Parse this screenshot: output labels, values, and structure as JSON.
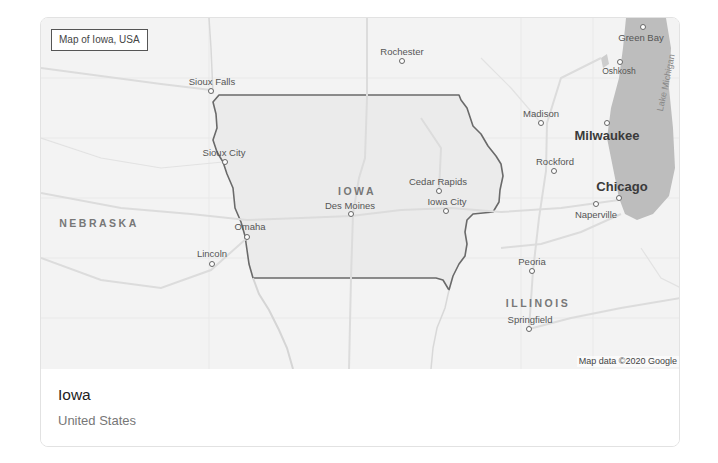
{
  "card": {
    "map_caption": "Map of Iowa, USA",
    "attribution": "Map data ©2020 Google",
    "title": "Iowa",
    "subtitle": "United States"
  },
  "map": {
    "colors": {
      "land": "#f3f3f3",
      "highlight_region": "#ebebeb",
      "water": "#bdbdbd",
      "border": "#6a6a6a",
      "roads": "#dedede"
    },
    "states": [
      {
        "id": "iowa",
        "label": "IOWA",
        "x": 316,
        "y": 168
      },
      {
        "id": "nebraska",
        "label": "NEBRASKA",
        "x": 58,
        "y": 201
      },
      {
        "id": "illinois",
        "label": "ILLINOIS",
        "x": 498,
        "y": 282
      }
    ],
    "water": [
      {
        "id": "lake-michigan",
        "label": "Lake Michigan",
        "x": 619,
        "y": 80
      }
    ],
    "cities": [
      {
        "id": "sioux-falls",
        "label": "Sioux Falls",
        "x": 171,
        "y": 72,
        "dot_x": 170,
        "dot_y": 73,
        "size": "normal",
        "label_dx": 0,
        "label_dy": -14
      },
      {
        "id": "rochester",
        "label": "Rochester",
        "x": 361,
        "y": 33,
        "dot_x": 361,
        "dot_y": 43,
        "size": "normal",
        "label_dx": 0,
        "label_dy": -14
      },
      {
        "id": "green-bay",
        "label": "Green Bay",
        "x": 603,
        "y": 18,
        "dot_x": 602,
        "dot_y": 11,
        "size": "normal",
        "label_dx": 0,
        "label_dy": 5
      },
      {
        "id": "oshkosh",
        "label": "Oshkosh",
        "x": 579,
        "y": 50,
        "dot_x": 579,
        "dot_y": 44,
        "size": "normal",
        "label_dx": 0,
        "label_dy": 4
      },
      {
        "id": "madison",
        "label": "Madison",
        "x": 500,
        "y": 94,
        "dot_x": 500,
        "dot_y": 105,
        "size": "normal",
        "label_dx": 0,
        "label_dy": -14
      },
      {
        "id": "milwaukee",
        "label": "Milwaukee",
        "x": 566,
        "y": 115,
        "dot_x": 566,
        "dot_y": 106,
        "size": "big",
        "label_dx": 0,
        "label_dy": 5
      },
      {
        "id": "sioux-city",
        "label": "Sioux City",
        "x": 183,
        "y": 133,
        "dot_x": 184,
        "dot_y": 144,
        "size": "normal",
        "label_dx": 0,
        "label_dy": -14
      },
      {
        "id": "rockford",
        "label": "Rockford",
        "x": 516,
        "y": 142,
        "dot_x": 513,
        "dot_y": 153,
        "size": "normal",
        "label_dx": 0,
        "label_dy": -14
      },
      {
        "id": "chicago",
        "label": "Chicago",
        "x": 581,
        "y": 167,
        "dot_x": 578,
        "dot_y": 180,
        "size": "big",
        "label_dx": 0,
        "label_dy": -17
      },
      {
        "id": "cedar-rapids",
        "label": "Cedar Rapids",
        "x": 395,
        "y": 162,
        "dot_x": 398,
        "dot_y": 173,
        "size": "normal",
        "label_dx": 0,
        "label_dy": -14
      },
      {
        "id": "iowa-city",
        "label": "Iowa City",
        "x": 406,
        "y": 180,
        "dot_x": 405,
        "dot_y": 193,
        "size": "normal",
        "label_dx": 0,
        "label_dy": -14
      },
      {
        "id": "des-moines",
        "label": "Des Moines",
        "x": 309,
        "y": 185,
        "dot_x": 310,
        "dot_y": 196,
        "size": "normal",
        "label_dx": 0,
        "label_dy": -14
      },
      {
        "id": "naperville",
        "label": "Naperville",
        "x": 556,
        "y": 194,
        "dot_x": 555,
        "dot_y": 185,
        "size": "normal",
        "label_dx": 0,
        "label_dy": 5
      },
      {
        "id": "omaha",
        "label": "Omaha",
        "x": 206,
        "y": 207,
        "dot_x": 206,
        "dot_y": 219,
        "size": "normal",
        "label_dx": 0,
        "label_dy": -14
      },
      {
        "id": "lincoln",
        "label": "Lincoln",
        "x": 171,
        "y": 230,
        "dot_x": 171,
        "dot_y": 244,
        "size": "normal",
        "label_dx": 0,
        "label_dy": -14
      },
      {
        "id": "peoria",
        "label": "Peoria",
        "x": 491,
        "y": 241,
        "dot_x": 491,
        "dot_y": 253,
        "size": "normal",
        "label_dx": 0,
        "label_dy": -14
      },
      {
        "id": "springfield",
        "label": "Springfield",
        "x": 488,
        "y": 297,
        "dot_x": 488,
        "dot_y": 311,
        "size": "normal",
        "label_dx": 0,
        "label_dy": -14
      }
    ]
  }
}
